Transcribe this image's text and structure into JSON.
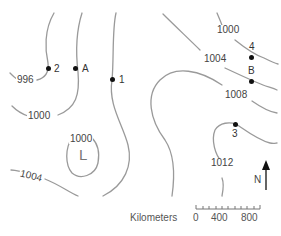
{
  "map": {
    "type": "isobar-weather-map",
    "line_color": "#9a9a9a",
    "isobar_labels": [
      {
        "id": "996",
        "text": "996"
      },
      {
        "id": "1000-left",
        "text": "1000"
      },
      {
        "id": "1000-low",
        "text": "1000"
      },
      {
        "id": "1004-left",
        "text": "1004"
      },
      {
        "id": "1000-right",
        "text": "1000"
      },
      {
        "id": "1004-right",
        "text": "1004"
      },
      {
        "id": "1008",
        "text": "1008"
      },
      {
        "id": "1012",
        "text": "1012"
      }
    ],
    "pressure_center": {
      "text": "L",
      "meaning": "low pressure"
    },
    "points": [
      {
        "id": "2",
        "label": "2"
      },
      {
        "id": "A",
        "label": "A"
      },
      {
        "id": "1",
        "label": "1"
      },
      {
        "id": "4",
        "label": "4"
      },
      {
        "id": "B",
        "label": "B"
      },
      {
        "id": "3",
        "label": "3"
      }
    ],
    "north_arrow": {
      "label": "N"
    },
    "scale_bar": {
      "title": "Kilometers",
      "ticks": [
        "0",
        "400",
        "800"
      ]
    }
  }
}
